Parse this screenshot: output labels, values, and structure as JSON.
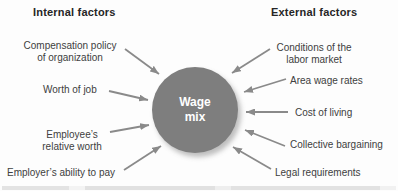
{
  "headers": {
    "internal": "Internal factors",
    "external": "External factors"
  },
  "center": {
    "label": "Wage\nmix",
    "fill": "#7e7e7e",
    "text_color": "#ffffff"
  },
  "internal_factors": [
    "Compensation policy\nof organization",
    "Worth of job",
    "Employee’s\nrelative worth",
    "Employer’s ability to pay"
  ],
  "external_factors": [
    "Conditions of the\nlabor market",
    "Area wage rates",
    "Cost of living",
    "Collective bargaining",
    "Legal requirements"
  ],
  "colors": {
    "arrow": "#8a8a8a",
    "circle_fill": "#7e7e7e",
    "label_text": "#404040",
    "header_text": "#262626",
    "background": "#fdfdfd"
  }
}
